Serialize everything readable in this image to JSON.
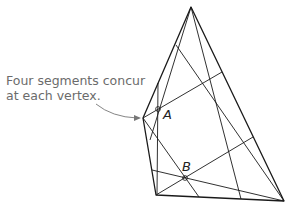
{
  "annotation": {
    "line1": "Four segments concur",
    "line2": "at each vertex."
  },
  "points": {
    "A": {
      "label": "A",
      "x": 158,
      "y": 109
    },
    "B": {
      "label": "B",
      "x": 185,
      "y": 178
    }
  },
  "vertices": {
    "top": [
      191,
      7
    ],
    "left": [
      143,
      118
    ],
    "bottom_left": [
      156,
      195
    ],
    "bottom_right": [
      284,
      201
    ]
  },
  "colors": {
    "line": "#1a1a1a",
    "annotation_text": "#6b6b6b",
    "arrow": "#777777"
  }
}
